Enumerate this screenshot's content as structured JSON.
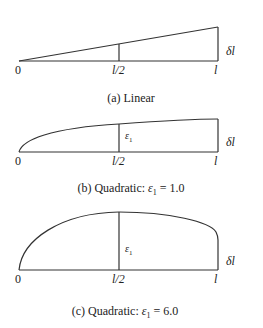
{
  "panels": [
    {
      "id": "a",
      "caption": "(a) Linear",
      "tick_start": "0",
      "tick_mid": "l/2",
      "tick_end": "l",
      "side_label": "δl"
    },
    {
      "id": "b",
      "caption": "(b) Quadratic: ε1 = 1.0",
      "caption_prefix": "(b) Quadratic: ",
      "caption_eps": "ε",
      "caption_sub": "1",
      "caption_value": " = 1.0",
      "tick_start": "0",
      "tick_mid": "l/2",
      "tick_end": "l",
      "side_label": "δl",
      "mid_label": "ε",
      "mid_label_sub": "1"
    },
    {
      "id": "c",
      "caption": "(c) Quadratic: ε1 = 6.0",
      "caption_prefix": "(c) Quadratic: ",
      "caption_eps": "ε",
      "caption_sub": "1",
      "caption_value": " = 6.0",
      "tick_start": "0",
      "tick_mid": "l/2",
      "tick_end": "l",
      "side_label": "δl",
      "mid_label": "ε",
      "mid_label_sub": "1"
    }
  ]
}
